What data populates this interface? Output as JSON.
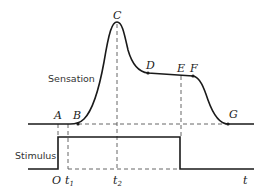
{
  "diagram": {
    "type": "sensation-stimulus-timing",
    "labels": {
      "sensation": "Sensation",
      "stimulus": "Stimulus",
      "time_axis": "t"
    },
    "points": {
      "A": "A",
      "B": "B",
      "C": "C",
      "D": "D",
      "E": "E",
      "F": "F",
      "G": "G"
    },
    "time_marks": {
      "origin": "O",
      "t1": "t",
      "t1_sub": "1",
      "t2": "t",
      "t2_sub": "2"
    },
    "colors": {
      "line": "#1a1a1a",
      "dashed": "#555555",
      "background": "#ffffff"
    }
  }
}
